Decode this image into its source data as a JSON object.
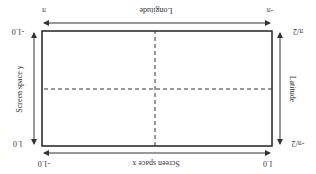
{
  "diagram": {
    "rotation_deg": 180,
    "top_axis": {
      "label": "Screen space x",
      "left_tick": "1.0",
      "right_tick": "-1.0"
    },
    "bottom_axis": {
      "label": "Longitude",
      "left_tick": "-π",
      "right_tick": "π"
    },
    "left_axis": {
      "label": "Latitude",
      "top_tick": "-π/2",
      "bottom_tick": "π/2"
    },
    "right_axis": {
      "label": "Screen space y",
      "top_tick": "1.0",
      "bottom_tick": "-1.0"
    }
  }
}
